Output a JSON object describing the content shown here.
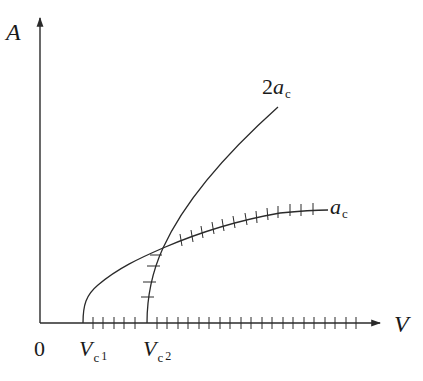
{
  "axes": {
    "y_label": "A",
    "x_label": "V",
    "origin_label": "0"
  },
  "markers": [
    {
      "name": "V",
      "sub": "c",
      "index": "1"
    },
    {
      "name": "V",
      "sub": "c",
      "index": "2"
    }
  ],
  "curves": [
    {
      "label_coef": "",
      "label_var": "a",
      "label_sub": "c",
      "stable_branch": "after crossing (hatched)"
    },
    {
      "label_coef": "2",
      "label_var": "a",
      "label_sub": "c",
      "stable_branch": "below crossing (hatched)"
    }
  ],
  "colors": {
    "line": "#2a2a2a",
    "text": "#1a1a1a",
    "background": "#ffffff"
  }
}
